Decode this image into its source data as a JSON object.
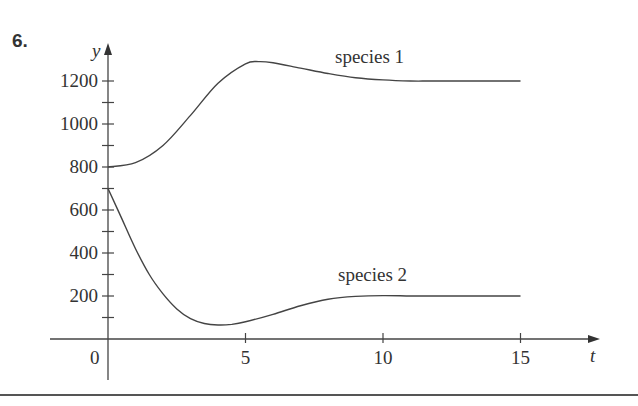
{
  "problem": {
    "number": "6."
  },
  "chart_data": {
    "type": "line",
    "title": "",
    "xlabel": "t",
    "ylabel": "y",
    "xlim": [
      0,
      17
    ],
    "ylim": [
      0,
      1400
    ],
    "grid": false,
    "legend": "inline labels",
    "x_ticks": [
      5,
      10,
      15
    ],
    "x_tick_labels": [
      "5",
      "10",
      "15"
    ],
    "y_ticks": [
      200,
      400,
      600,
      800,
      1000,
      1200
    ],
    "y_tick_labels": [
      "200",
      "400",
      "600",
      "800",
      "1000",
      "1200"
    ],
    "y_minor_ticks": [
      100,
      300,
      500,
      700,
      900,
      1100
    ],
    "origin_label": "0",
    "series": [
      {
        "name": "species 1",
        "x": [
          0,
          1,
          2,
          3,
          4,
          5,
          5.5,
          6,
          7,
          8,
          9,
          10,
          11,
          12,
          15
        ],
        "values": [
          800,
          820,
          900,
          1040,
          1190,
          1280,
          1290,
          1285,
          1260,
          1235,
          1215,
          1205,
          1200,
          1200,
          1200
        ]
      },
      {
        "name": "species 2",
        "x": [
          0,
          0.5,
          1,
          1.5,
          2,
          2.5,
          3,
          3.5,
          4,
          4.5,
          5,
          6,
          7,
          8,
          9,
          10,
          11,
          12,
          15
        ],
        "values": [
          700,
          560,
          420,
          300,
          210,
          140,
          95,
          72,
          65,
          68,
          80,
          115,
          155,
          185,
          198,
          202,
          200,
          200,
          200
        ]
      }
    ],
    "annotations": [
      {
        "text": "species 1",
        "near_t": 9.5,
        "near_y": 1330
      },
      {
        "text": "species 2",
        "near_t": 9.5,
        "near_y": 320
      }
    ]
  }
}
